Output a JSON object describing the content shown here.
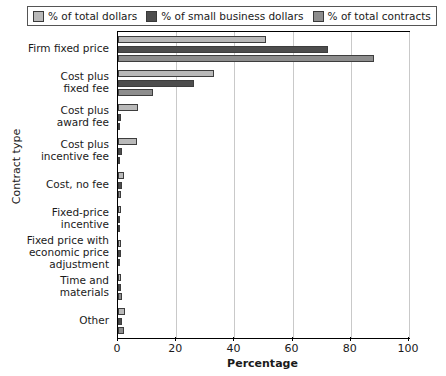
{
  "chart_data": {
    "type": "bar",
    "orientation": "horizontal",
    "title": "",
    "xlabel": "Percentage",
    "ylabel": "Contract type",
    "xlim": [
      0,
      100
    ],
    "xticks": [
      0,
      20,
      40,
      60,
      80,
      100
    ],
    "grid": true,
    "legend_position": "top",
    "categories": [
      "Firm fixed price",
      "Cost plus\nfixed fee",
      "Cost plus\naward fee",
      "Cost plus\nincentive fee",
      "Cost, no fee",
      "Fixed-price\nincentive",
      "Fixed price with\neconomic price\nadjustment",
      "Time and\nmaterials",
      "Other"
    ],
    "series": [
      {
        "name": "% of total dollars",
        "color": "#b9b9b9",
        "values": [
          51,
          33,
          7,
          6.5,
          2,
          1,
          1,
          1,
          2.5
        ]
      },
      {
        "name": "% of small business dollars",
        "color": "#4d4d4d",
        "values": [
          72,
          26,
          1,
          1.5,
          1.5,
          0.6,
          1,
          1,
          1.5
        ]
      },
      {
        "name": "% of total contracts",
        "color": "#8d8d8d",
        "values": [
          88,
          12,
          0.5,
          0.4,
          1,
          0.4,
          0.6,
          1.5,
          2
        ]
      }
    ]
  },
  "axis": {
    "x_title": "Percentage",
    "y_title": "Contract type",
    "x_tick_labels": [
      "0",
      "20",
      "40",
      "60",
      "80",
      "100"
    ]
  },
  "legend": {
    "items": [
      {
        "label": "% of total dollars",
        "color": "#b9b9b9"
      },
      {
        "label": "% of small business dollars",
        "color": "#4d4d4d"
      },
      {
        "label": "% of total contracts",
        "color": "#8d8d8d"
      }
    ]
  }
}
